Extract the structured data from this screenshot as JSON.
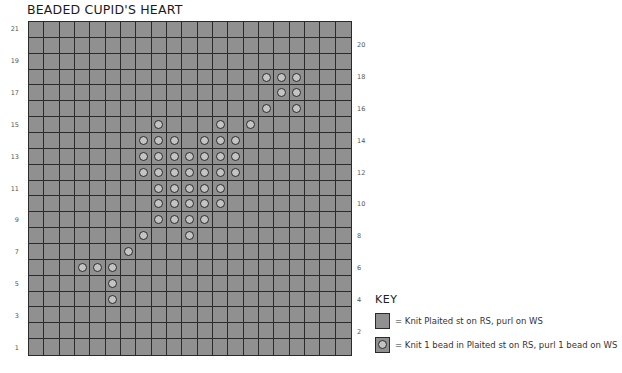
{
  "title": "BEADED CUPID'S HEART",
  "grid": {
    "columns": 21,
    "rows": 21,
    "left_labels": [
      "21",
      "19",
      "17",
      "15",
      "13",
      "11",
      "9",
      "7",
      "5",
      "3",
      "1"
    ],
    "right_labels": [
      "20",
      "18",
      "16",
      "14",
      "12",
      "10",
      "8",
      "6",
      "4",
      "2"
    ],
    "background_color": "#909090",
    "bead_color": "#c4c4c4",
    "beads": [
      {
        "row": 18,
        "cols": [
          15,
          16,
          17
        ]
      },
      {
        "row": 17,
        "cols": [
          16,
          17
        ]
      },
      {
        "row": 16,
        "cols": [
          15,
          17
        ]
      },
      {
        "row": 15,
        "cols": [
          8,
          12,
          14
        ]
      },
      {
        "row": 14,
        "cols": [
          7,
          8,
          9,
          11,
          12,
          13
        ]
      },
      {
        "row": 13,
        "cols": [
          7,
          8,
          9,
          10,
          11,
          12,
          13
        ]
      },
      {
        "row": 12,
        "cols": [
          7,
          8,
          9,
          10,
          11,
          12,
          13
        ]
      },
      {
        "row": 11,
        "cols": [
          8,
          9,
          10,
          11,
          12
        ]
      },
      {
        "row": 10,
        "cols": [
          8,
          9,
          10,
          11,
          12
        ]
      },
      {
        "row": 9,
        "cols": [
          8,
          9,
          10,
          11
        ]
      },
      {
        "row": 8,
        "cols": [
          7,
          10
        ]
      },
      {
        "row": 7,
        "cols": [
          6
        ]
      },
      {
        "row": 6,
        "cols": [
          3,
          4,
          5
        ]
      },
      {
        "row": 5,
        "cols": [
          5
        ]
      },
      {
        "row": 4,
        "cols": [
          5
        ]
      }
    ]
  },
  "key": {
    "title": "KEY",
    "items": [
      {
        "symbol": "plain-square",
        "label": "= Knit Plaited st on RS, purl on WS"
      },
      {
        "symbol": "bead-circle",
        "label": "= Knit 1 bead in Plaited st on RS, purl 1 bead on WS"
      }
    ]
  }
}
